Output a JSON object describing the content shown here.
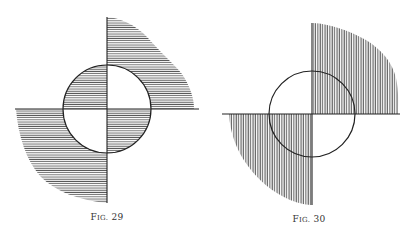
{
  "figures": [
    {
      "id": "fig29",
      "caption_prefix": "F",
      "caption_smallcaps": "IG.",
      "caption_number": "29",
      "hatch": "horizontal",
      "circle": {
        "cx": 107,
        "cy": 109,
        "r": 44
      },
      "axes": {
        "h": {
          "x1": 15,
          "x2": 199,
          "y": 109
        },
        "v": {
          "x": 107,
          "y1": 17,
          "y2": 203
        }
      },
      "shaded_regions": [
        "outer-top-right",
        "outer-bottom-left",
        "inner-top-left",
        "inner-bottom-right"
      ]
    },
    {
      "id": "fig30",
      "caption_prefix": "F",
      "caption_smallcaps": "IG.",
      "caption_number": "30",
      "hatch": "vertical",
      "circle": {
        "cx": 312,
        "cy": 114,
        "r": 43
      },
      "axes": {
        "h": {
          "x1": 222,
          "x2": 400,
          "y": 114
        },
        "v": {
          "x": 312,
          "y1": 23,
          "y2": 205
        }
      },
      "shaded_regions": [
        "top-right",
        "bottom-left"
      ]
    }
  ],
  "colors": {
    "ink": "#222222",
    "hatch": "#555555",
    "background": "#ffffff"
  }
}
